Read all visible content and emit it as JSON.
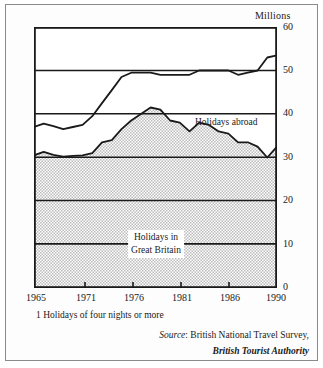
{
  "figure": {
    "units_label": "Millions",
    "footnote": "1 Holidays of four nights or more",
    "source_prefix": "Source",
    "source_rest": ": British National Travel Survey,",
    "source_line2": "British Tourist Authority"
  },
  "annotations": {
    "abroad": "Holidays abroad",
    "gb_line1": "Holidays in",
    "gb_line2": "Great Britain"
  },
  "axes": {
    "y_ticks": [
      "60",
      "50",
      "40",
      "30",
      "20",
      "10",
      "0"
    ],
    "x_ticks": [
      "1965",
      "1971",
      "1976",
      "1981",
      "1986",
      "1990"
    ]
  },
  "colors": {
    "line": "#1a1a1a",
    "fill": "#d6d6d6",
    "frame": "#8a8a8a",
    "background": "#ffffff"
  },
  "chart_data": {
    "type": "area",
    "title": "",
    "subtitle": "",
    "xlabel": "",
    "ylabel": "Millions",
    "xlim": [
      1965,
      1990
    ],
    "ylim": [
      0,
      60
    ],
    "y_ticks": [
      0,
      10,
      20,
      30,
      40,
      50,
      60
    ],
    "x_ticks": [
      1965,
      1971,
      1976,
      1981,
      1986,
      1990
    ],
    "grid": true,
    "legend": "inline annotations",
    "stacked": true,
    "x": [
      1965,
      1966,
      1967,
      1968,
      1969,
      1970,
      1971,
      1972,
      1973,
      1974,
      1975,
      1976,
      1977,
      1978,
      1979,
      1980,
      1981,
      1982,
      1983,
      1984,
      1985,
      1986,
      1987,
      1988,
      1989,
      1990
    ],
    "series": [
      {
        "name": "Holidays in Great Britain",
        "label": "Holidays in Great Britain",
        "values": [
          30.5,
          31.3,
          30.6,
          30.2,
          30.4,
          30.5,
          31.0,
          33.5,
          34.0,
          36.5,
          38.5,
          40.0,
          41.5,
          41.0,
          38.5,
          38.0,
          36.0,
          38.0,
          37.5,
          36.0,
          35.5,
          33.5,
          33.5,
          32.5,
          30.0,
          32.5
        ]
      },
      {
        "name": "Holidays abroad",
        "label": "Holidays abroad",
        "values": [
          6.5,
          6.5,
          6.6,
          6.3,
          6.6,
          7.0,
          8.5,
          9.0,
          11.5,
          12.0,
          11.0,
          9.5,
          8.0,
          8.0,
          10.5,
          11.0,
          13.0,
          12.0,
          12.5,
          14.0,
          14.5,
          15.5,
          16.0,
          17.5,
          23.0,
          21.0
        ]
      }
    ],
    "totals": [
      37.0,
      37.8,
      37.2,
      36.5,
      37.0,
      37.5,
      39.5,
      42.5,
      45.5,
      48.5,
      49.5,
      49.5,
      49.5,
      49.0,
      49.0,
      49.0,
      49.0,
      50.0,
      50.0,
      50.0,
      50.0,
      49.0,
      49.5,
      50.0,
      53.0,
      53.5
    ]
  }
}
